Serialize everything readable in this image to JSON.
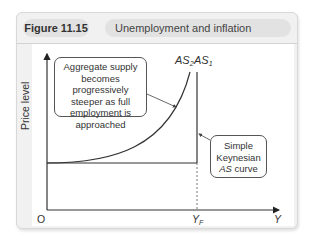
{
  "figure": {
    "number": "Figure 11.15",
    "title": "Unemployment and inflation"
  },
  "axes": {
    "y_label": "Price level",
    "x_label": "Y",
    "origin": "O",
    "x_marker": "Y",
    "x_marker_sub": "F"
  },
  "curves": {
    "as2_label": "AS",
    "as2_sub": "2",
    "as1_label": "AS",
    "as1_sub": "1"
  },
  "callouts": {
    "progressive": {
      "line1": "Aggregate supply",
      "line2": "becomes progressively",
      "line3": "steeper as full",
      "line4": "employment is",
      "line5": "approached"
    },
    "keynesian": {
      "line1": "Simple",
      "line2": "Keynesian",
      "line3_italic": "AS",
      "line3_rest": " curve"
    }
  },
  "colors": {
    "panel_bg": "#f1f1f1",
    "pill_bg": "#e2e2e2",
    "line": "#333333"
  }
}
